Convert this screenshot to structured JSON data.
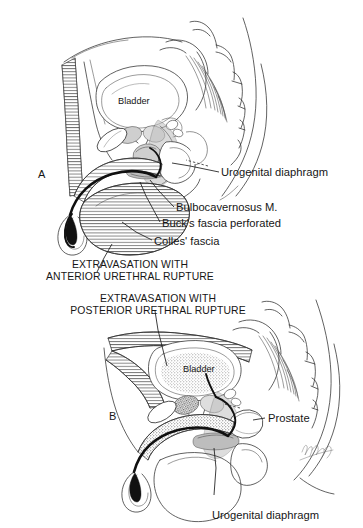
{
  "figure": {
    "title_alt": "Extravasation patterns in anterior and posterior urethral rupture",
    "background_color": "#ffffff",
    "ink_color": "#161616",
    "signature": "Nagata"
  },
  "panels": [
    {
      "id": "A",
      "panel_label": "A",
      "caption_lines": [
        "EXTRAVASATION WITH",
        "ANTERIOR URETHRAL RUPTURE"
      ],
      "labels": [
        {
          "name": "bladder",
          "text": "Bladder"
        },
        {
          "name": "urogenital-diaphragm",
          "text": "Urogenital diaphragm"
        },
        {
          "name": "bulbocavernosus-muscle",
          "text": "Bulbocavernosus M."
        },
        {
          "name": "bucks-fascia-perforated",
          "text": "Buck's fascia perforated"
        },
        {
          "name": "colles-fascia",
          "text": "Colles' fascia"
        }
      ]
    },
    {
      "id": "B",
      "panel_label": "B",
      "caption_lines": [
        "EXTRAVASATION WITH",
        "POSTERIOR URETHRAL RUPTURE"
      ],
      "labels": [
        {
          "name": "bladder",
          "text": "Bladder"
        },
        {
          "name": "prostate",
          "text": "Prostate"
        },
        {
          "name": "urogenital-diaphragm",
          "text": "Urogenital diaphragm"
        }
      ]
    }
  ]
}
